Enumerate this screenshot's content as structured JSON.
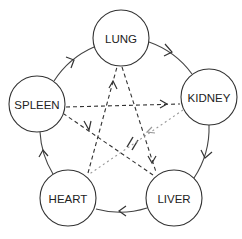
{
  "diagram": {
    "title": "",
    "nodes": [
      {
        "id": "lung",
        "label": "LUNG",
        "cx": 121,
        "cy": 38,
        "r": 28
      },
      {
        "id": "kidney",
        "label": "KIDNEY",
        "cx": 209,
        "cy": 97,
        "r": 28
      },
      {
        "id": "liver",
        "label": "LIVER",
        "cx": 174,
        "cy": 198,
        "r": 28
      },
      {
        "id": "heart",
        "label": "HEART",
        "cx": 68,
        "cy": 198,
        "r": 28
      },
      {
        "id": "spleen",
        "label": "SPLEEN",
        "cx": 37,
        "cy": 104,
        "r": 28
      }
    ],
    "outer_cycle": {
      "style": "solid",
      "direction": "clockwise",
      "edges": [
        {
          "from": "LUNG",
          "to": "KIDNEY"
        },
        {
          "from": "KIDNEY",
          "to": "LIVER"
        },
        {
          "from": "LIVER",
          "to": "HEART"
        },
        {
          "from": "HEART",
          "to": "SPLEEN"
        },
        {
          "from": "SPLEEN",
          "to": "LUNG"
        }
      ]
    },
    "inner_star": {
      "style": "dashed",
      "edges": [
        {
          "from": "HEART",
          "to": "LUNG",
          "style": "dashed"
        },
        {
          "from": "LUNG",
          "to": "LIVER",
          "style": "dashed"
        },
        {
          "from": "LIVER",
          "to": "SPLEEN",
          "style": "dashed",
          "blocked_mark": "//"
        },
        {
          "from": "SPLEEN",
          "to": "KIDNEY",
          "style": "dashed"
        },
        {
          "from": "KIDNEY",
          "to": "HEART",
          "style": "dotted-light"
        }
      ]
    },
    "colors": {
      "line": "#333333",
      "light_line": "#999999",
      "background": "#ffffff"
    }
  }
}
